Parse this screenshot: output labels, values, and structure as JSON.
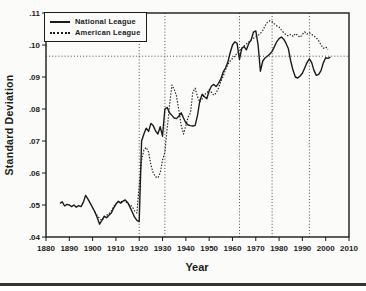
{
  "colors": {
    "ink": "#1b1b1b",
    "grid": "#3c3c3c",
    "paper": "#fbfbf9",
    "page_rule": "#35342f"
  },
  "chart_data": {
    "type": "line",
    "title": "",
    "xlabel": "Year",
    "ylabel": "Standard Deviation",
    "xlim": [
      1880,
      2010
    ],
    "ylim": [
      0.04,
      0.11
    ],
    "x_ticks": [
      1880,
      1890,
      1900,
      1910,
      1920,
      1930,
      1940,
      1950,
      1960,
      1970,
      1980,
      1990,
      2000,
      2010
    ],
    "x_tick_labels": [
      "1880",
      "1890",
      "1900",
      "1910",
      "1920",
      "1930",
      "1940",
      "1950",
      "1960",
      "1970",
      "1980",
      "1990",
      "2000",
      "2010"
    ],
    "y_ticks": [
      0.04,
      0.05,
      0.06,
      0.07,
      0.08,
      0.09,
      0.1,
      0.11
    ],
    "y_tick_labels": [
      ".04",
      ".05",
      ".06",
      ".07",
      ".08",
      ".09",
      ".10",
      ".11"
    ],
    "grid": {
      "vertical_dotted_years": [
        1920,
        1931,
        1963,
        1977,
        1993
      ],
      "horizontal_dotted_value": 0.0965
    },
    "legend_position": "top-left",
    "legend": [
      "National League",
      "American League"
    ],
    "series": [
      {
        "name": "National League",
        "style": "solid",
        "data_name": "national-league-line",
        "x": [
          1886,
          1887,
          1888,
          1889,
          1890,
          1891,
          1892,
          1893,
          1894,
          1895,
          1896,
          1897,
          1898,
          1899,
          1900,
          1901,
          1902,
          1903,
          1904,
          1905,
          1906,
          1907,
          1908,
          1909,
          1910,
          1911,
          1912,
          1913,
          1914,
          1915,
          1916,
          1917,
          1918,
          1919,
          1920,
          1921,
          1922,
          1923,
          1924,
          1925,
          1926,
          1927,
          1928,
          1929,
          1930,
          1931,
          1932,
          1933,
          1934,
          1935,
          1936,
          1937,
          1938,
          1939,
          1940,
          1941,
          1942,
          1943,
          1944,
          1945,
          1946,
          1947,
          1948,
          1949,
          1950,
          1951,
          1952,
          1953,
          1954,
          1955,
          1956,
          1957,
          1958,
          1959,
          1960,
          1961,
          1962,
          1963,
          1964,
          1965,
          1966,
          1967,
          1968,
          1969,
          1970,
          1971,
          1972,
          1973,
          1974,
          1975,
          1976,
          1977,
          1978,
          1979,
          1980,
          1981,
          1982,
          1983,
          1984,
          1985,
          1986,
          1987,
          1988,
          1989,
          1990,
          1991,
          1992,
          1993,
          1994,
          1995,
          1996,
          1997,
          1998,
          1999,
          2000,
          2001,
          2002
        ],
        "values": [
          0.0505,
          0.051,
          0.0497,
          0.0502,
          0.05,
          0.0495,
          0.05,
          0.0493,
          0.0498,
          0.0495,
          0.0508,
          0.053,
          0.0518,
          0.0505,
          0.0492,
          0.0478,
          0.046,
          0.044,
          0.0452,
          0.0465,
          0.046,
          0.0468,
          0.0475,
          0.049,
          0.0502,
          0.0512,
          0.0506,
          0.0512,
          0.0516,
          0.0508,
          0.0494,
          0.0478,
          0.0462,
          0.0452,
          0.0448,
          0.07,
          0.0722,
          0.074,
          0.073,
          0.0755,
          0.0748,
          0.0732,
          0.0722,
          0.0745,
          0.0715,
          0.08,
          0.0805,
          0.0788,
          0.078,
          0.0772,
          0.077,
          0.0778,
          0.0788,
          0.0772,
          0.0757,
          0.075,
          0.0748,
          0.0747,
          0.0749,
          0.078,
          0.0825,
          0.0846,
          0.0838,
          0.0832,
          0.0857,
          0.0872,
          0.0877,
          0.087,
          0.088,
          0.0893,
          0.0915,
          0.0928,
          0.0946,
          0.0975,
          0.1,
          0.101,
          0.1005,
          0.0955,
          0.099,
          0.0995,
          0.0985,
          0.1005,
          0.1015,
          0.104,
          0.1044,
          0.1,
          0.0918,
          0.095,
          0.096,
          0.0965,
          0.0972,
          0.098,
          0.0995,
          0.101,
          0.102,
          0.1025,
          0.1018,
          0.1005,
          0.0988,
          0.095,
          0.092,
          0.09,
          0.0897,
          0.0903,
          0.0912,
          0.0928,
          0.0945,
          0.0957,
          0.0945,
          0.092,
          0.0905,
          0.0908,
          0.092,
          0.0945,
          0.096,
          0.0958,
          0.0962
        ]
      },
      {
        "name": "American League",
        "style": "dotted",
        "data_name": "american-league-line",
        "x": [
          1901,
          1902,
          1903,
          1904,
          1905,
          1906,
          1907,
          1908,
          1909,
          1910,
          1911,
          1912,
          1913,
          1914,
          1915,
          1916,
          1917,
          1918,
          1919,
          1920,
          1921,
          1922,
          1923,
          1924,
          1925,
          1926,
          1927,
          1928,
          1929,
          1930,
          1931,
          1932,
          1933,
          1934,
          1935,
          1936,
          1937,
          1938,
          1939,
          1940,
          1941,
          1942,
          1943,
          1944,
          1945,
          1946,
          1947,
          1948,
          1949,
          1950,
          1951,
          1952,
          1953,
          1954,
          1955,
          1956,
          1957,
          1958,
          1959,
          1960,
          1961,
          1962,
          1963,
          1964,
          1965,
          1966,
          1967,
          1968,
          1969,
          1970,
          1971,
          1972,
          1973,
          1974,
          1975,
          1976,
          1977,
          1978,
          1979,
          1980,
          1981,
          1982,
          1983,
          1984,
          1985,
          1986,
          1987,
          1988,
          1989,
          1990,
          1991,
          1992,
          1993,
          1994,
          1995,
          1996,
          1997,
          1998,
          1999,
          2000,
          2001
        ],
        "values": [
          0.0478,
          0.0467,
          0.0458,
          0.0452,
          0.0462,
          0.0468,
          0.0472,
          0.0482,
          0.0495,
          0.0505,
          0.051,
          0.0508,
          0.0514,
          0.0512,
          0.0505,
          0.05,
          0.0495,
          0.0482,
          0.0475,
          0.056,
          0.064,
          0.0672,
          0.068,
          0.0665,
          0.0625,
          0.06,
          0.0588,
          0.0585,
          0.06,
          0.064,
          0.0665,
          0.074,
          0.081,
          0.0875,
          0.0862,
          0.084,
          0.0795,
          0.0748,
          0.0722,
          0.0748,
          0.0775,
          0.0788,
          0.0852,
          0.0865,
          0.0838,
          0.0822,
          0.0832,
          0.0845,
          0.085,
          0.086,
          0.0852,
          0.0843,
          0.085,
          0.0865,
          0.0885,
          0.0902,
          0.0922,
          0.0938,
          0.095,
          0.0958,
          0.0966,
          0.0974,
          0.0982,
          0.099,
          0.0997,
          0.1003,
          0.101,
          0.1016,
          0.1021,
          0.1026,
          0.103,
          0.1036,
          0.1046,
          0.106,
          0.1071,
          0.1076,
          0.1073,
          0.1066,
          0.106,
          0.1056,
          0.1047,
          0.1038,
          0.1032,
          0.1028,
          0.1033,
          0.1027,
          0.1036,
          0.103,
          0.1024,
          0.1033,
          0.1041,
          0.1034,
          0.1038,
          0.1033,
          0.1028,
          0.1022,
          0.1013,
          0.1,
          0.099,
          0.0994,
          0.0986
        ]
      }
    ]
  }
}
